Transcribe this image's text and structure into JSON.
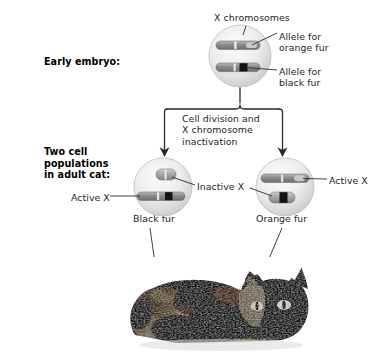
{
  "figure": {
    "type": "biology-diagram",
    "background_color": "#ffffff",
    "ink_color": "#1f1f1f"
  },
  "stage_labels": {
    "early_embryo": "Early embryo:",
    "adult_cat": "Two cell\npopulations\nin adult cat:"
  },
  "callouts": {
    "x_chromosomes": "X chromosomes",
    "allele_orange": "Allele for\norange fur",
    "allele_black": "Allele for\nblack fur",
    "cell_division": "Cell division and\nX chromosome\ninactivation",
    "active_x_left": "Active X",
    "inactive_x": "Inactive X",
    "active_x_right": "Active X",
    "black_fur": "Black fur",
    "orange_fur": "Orange fur"
  },
  "cells": [
    {
      "id": "embryo-cell",
      "role": "early embryo cell",
      "cx": 240,
      "cy": 56,
      "r": 31,
      "chromosomes": [
        {
          "id": "embryo-chr-orange",
          "allele": "orange",
          "state": "active",
          "band_color": "#b8b8b8"
        },
        {
          "id": "embryo-chr-black",
          "allele": "black",
          "state": "active",
          "band_color": "#141414"
        }
      ]
    },
    {
      "id": "black-fur-cell",
      "role": "adult cell expressing black fur",
      "cx": 163,
      "cy": 187,
      "r": 29,
      "fur": "Black fur",
      "chromosomes": [
        {
          "id": "black-cell-inactive-x",
          "allele": "orange",
          "state": "inactive",
          "band_color": "#9c9c9c"
        },
        {
          "id": "black-cell-active-x",
          "allele": "black",
          "state": "active",
          "band_color": "#141414"
        }
      ]
    },
    {
      "id": "orange-fur-cell",
      "role": "adult cell expressing orange fur",
      "cx": 285,
      "cy": 187,
      "r": 29,
      "fur": "Orange fur",
      "chromosomes": [
        {
          "id": "orange-cell-active-x",
          "allele": "orange",
          "state": "active",
          "band_color": "#b0b0b0"
        },
        {
          "id": "orange-cell-inactive-x",
          "allele": "black",
          "state": "inactive",
          "band_color": "#141414"
        }
      ]
    }
  ],
  "photo": {
    "id": "tortoiseshell-cat-photo",
    "caption": "",
    "description": "Grayscale photograph of a reclining tortoiseshell cat",
    "markers": [
      {
        "id": "marker-black-patch",
        "x": 164,
        "y": 326,
        "links_to": "Black fur"
      },
      {
        "id": "marker-orange-patch",
        "x": 255,
        "y": 295,
        "links_to": "Orange fur"
      }
    ]
  },
  "colors": {
    "line": "#2a2a2a",
    "cell_fill_outer": "#d7d7d7",
    "cell_fill_inner": "#f3f3f3",
    "chromosome_body": "#8d8d8d",
    "chromosome_dark": "#141414"
  }
}
